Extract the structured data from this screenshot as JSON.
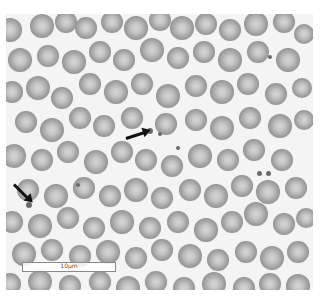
{
  "image": {
    "description": "Peripheral blood smear micrograph, red blood cells with platelets indicated by arrows",
    "background": "#f4f4f4"
  },
  "scale_bar": {
    "label": "10μm"
  },
  "arrows": [
    {
      "name": "arrow-platelet-center",
      "x": 126,
      "y": 137,
      "length": 22,
      "angle": -18
    },
    {
      "name": "arrow-platelet-left",
      "x": 14,
      "y": 183,
      "length": 22,
      "angle": 45
    }
  ],
  "platelets": [
    {
      "x": 150,
      "y": 131,
      "r": 3
    },
    {
      "x": 160,
      "y": 134,
      "r": 2
    },
    {
      "x": 178,
      "y": 148,
      "r": 2
    },
    {
      "x": 29,
      "y": 205,
      "r": 3
    },
    {
      "x": 78,
      "y": 185,
      "r": 2
    },
    {
      "x": 259,
      "y": 173,
      "r": 2.5
    },
    {
      "x": 268,
      "y": 173,
      "r": 2.5
    },
    {
      "x": 270,
      "y": 57,
      "r": 2
    }
  ],
  "cells": [
    [
      10,
      30,
      12
    ],
    [
      42,
      26,
      12
    ],
    [
      66,
      22,
      11
    ],
    [
      86,
      28,
      11
    ],
    [
      112,
      22,
      11
    ],
    [
      136,
      28,
      12
    ],
    [
      160,
      20,
      11
    ],
    [
      182,
      28,
      12
    ],
    [
      206,
      24,
      11
    ],
    [
      230,
      30,
      11
    ],
    [
      256,
      24,
      12
    ],
    [
      284,
      22,
      11
    ],
    [
      304,
      34,
      10
    ],
    [
      20,
      60,
      12
    ],
    [
      48,
      56,
      11
    ],
    [
      74,
      62,
      12
    ],
    [
      100,
      52,
      11
    ],
    [
      124,
      60,
      11
    ],
    [
      152,
      50,
      12
    ],
    [
      178,
      58,
      11
    ],
    [
      204,
      52,
      11
    ],
    [
      230,
      60,
      12
    ],
    [
      258,
      52,
      11
    ],
    [
      288,
      60,
      12
    ],
    [
      12,
      92,
      11
    ],
    [
      38,
      88,
      12
    ],
    [
      62,
      98,
      11
    ],
    [
      90,
      84,
      11
    ],
    [
      116,
      92,
      12
    ],
    [
      142,
      84,
      11
    ],
    [
      168,
      96,
      12
    ],
    [
      196,
      86,
      11
    ],
    [
      222,
      92,
      12
    ],
    [
      248,
      84,
      11
    ],
    [
      276,
      94,
      11
    ],
    [
      302,
      88,
      10
    ],
    [
      26,
      122,
      11
    ],
    [
      52,
      130,
      12
    ],
    [
      80,
      118,
      11
    ],
    [
      104,
      126,
      11
    ],
    [
      132,
      118,
      11
    ],
    [
      166,
      124,
      11
    ],
    [
      196,
      120,
      11
    ],
    [
      222,
      128,
      12
    ],
    [
      250,
      118,
      11
    ],
    [
      280,
      126,
      12
    ],
    [
      304,
      120,
      10
    ],
    [
      14,
      156,
      12
    ],
    [
      42,
      160,
      11
    ],
    [
      68,
      152,
      11
    ],
    [
      96,
      162,
      12
    ],
    [
      122,
      152,
      11
    ],
    [
      146,
      160,
      11
    ],
    [
      172,
      166,
      11
    ],
    [
      200,
      156,
      12
    ],
    [
      228,
      160,
      11
    ],
    [
      254,
      150,
      11
    ],
    [
      282,
      160,
      11
    ],
    [
      28,
      190,
      11
    ],
    [
      56,
      196,
      12
    ],
    [
      84,
      188,
      11
    ],
    [
      110,
      196,
      11
    ],
    [
      136,
      190,
      12
    ],
    [
      162,
      198,
      11
    ],
    [
      190,
      190,
      11
    ],
    [
      216,
      196,
      12
    ],
    [
      242,
      186,
      11
    ],
    [
      268,
      192,
      12
    ],
    [
      296,
      188,
      11
    ],
    [
      12,
      222,
      11
    ],
    [
      40,
      226,
      12
    ],
    [
      68,
      218,
      11
    ],
    [
      94,
      228,
      11
    ],
    [
      122,
      222,
      12
    ],
    [
      150,
      228,
      11
    ],
    [
      178,
      222,
      11
    ],
    [
      206,
      230,
      12
    ],
    [
      232,
      222,
      11
    ],
    [
      256,
      214,
      12
    ],
    [
      284,
      224,
      11
    ],
    [
      306,
      218,
      10
    ],
    [
      24,
      254,
      12
    ],
    [
      52,
      250,
      11
    ],
    [
      80,
      256,
      11
    ],
    [
      108,
      252,
      12
    ],
    [
      136,
      258,
      11
    ],
    [
      162,
      250,
      11
    ],
    [
      190,
      256,
      12
    ],
    [
      218,
      260,
      11
    ],
    [
      246,
      252,
      11
    ],
    [
      272,
      258,
      12
    ],
    [
      298,
      252,
      11
    ],
    [
      10,
      284,
      11
    ],
    [
      40,
      282,
      12
    ],
    [
      70,
      286,
      11
    ],
    [
      100,
      282,
      11
    ],
    [
      128,
      288,
      12
    ],
    [
      156,
      282,
      11
    ],
    [
      184,
      288,
      11
    ],
    [
      214,
      284,
      12
    ],
    [
      244,
      288,
      11
    ],
    [
      270,
      284,
      11
    ],
    [
      298,
      286,
      12
    ]
  ]
}
